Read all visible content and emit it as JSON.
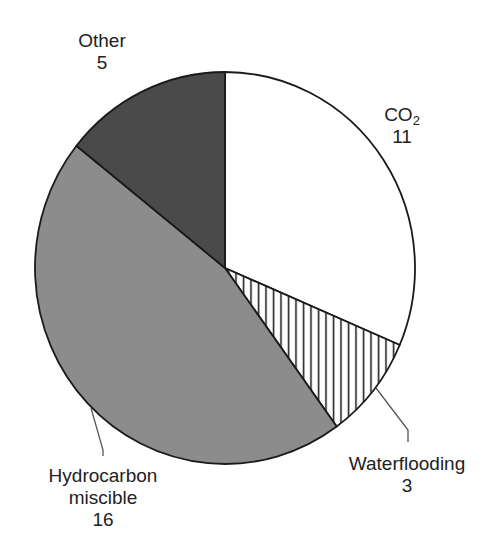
{
  "chart_data": {
    "type": "pie",
    "title": "",
    "slices": [
      {
        "label": "CO2",
        "value": 11,
        "fill": "#ffffff",
        "pattern": "none"
      },
      {
        "label": "Waterflooding",
        "value": 3,
        "fill": "#ffffff",
        "pattern": "vertical-hatch"
      },
      {
        "label": "Hydrocarbon miscible",
        "value": 16,
        "fill": "#8c8c8c",
        "pattern": "none"
      },
      {
        "label": "Other",
        "value": 5,
        "fill": "#4a4a4a",
        "pattern": "none"
      }
    ],
    "start_angle_deg": 0,
    "direction": "clockwise",
    "total": 35
  },
  "labels": {
    "co2": {
      "name": "CO",
      "sub": "2",
      "value": "11"
    },
    "waterflooding": {
      "line1": "Waterflooding",
      "value": "3"
    },
    "hydrocarbon": {
      "line1": "Hydrocarbon",
      "line2": "miscible",
      "value": "16"
    },
    "other": {
      "line1": "Other",
      "value": "5"
    }
  }
}
